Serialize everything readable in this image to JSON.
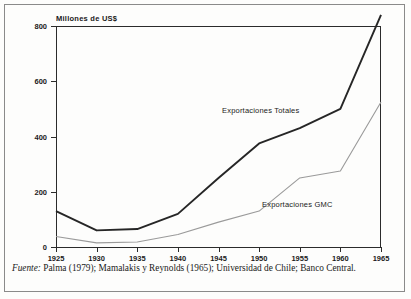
{
  "figure": {
    "y_axis_title": "Millones de US$",
    "series_labels": {
      "totales": "Exportaciones Totales",
      "gmc": "Exportaciones GMC"
    },
    "caption": {
      "source_word": "Fuente:",
      "text": " Palma (1979); Mamalakis y Reynolds (1965); Universidad de Chile; Banco Central."
    },
    "colors": {
      "totales_line": "#262626",
      "gmc_line": "#9a9a9a",
      "axis": "#2b2b2b",
      "page": "#fdfdfc",
      "frame": "#8a8a8a"
    }
  },
  "chart_data": {
    "type": "line",
    "title": "",
    "xlabel": "",
    "ylabel": "Millones de US$",
    "x": [
      1925,
      1930,
      1935,
      1940,
      1945,
      1950,
      1955,
      1960,
      1965
    ],
    "categories": [
      "1925",
      "1930",
      "1935",
      "1940",
      "1945",
      "1950",
      "1955",
      "1960",
      "1965"
    ],
    "xlim": [
      1925,
      1965
    ],
    "ylim": [
      0,
      800
    ],
    "yticks": [
      0,
      200,
      400,
      600,
      800
    ],
    "ytick_labels": [
      "0",
      "200",
      "400",
      "600",
      "800"
    ],
    "xticks": [
      1925,
      1930,
      1935,
      1940,
      1945,
      1950,
      1955,
      1960,
      1965
    ],
    "grid": false,
    "legend": "inline-annotations",
    "series": [
      {
        "name": "Exportaciones Totales",
        "color": "#262626",
        "values": [
          130,
          60,
          65,
          120,
          250,
          375,
          430,
          500,
          840
        ]
      },
      {
        "name": "Exportaciones GMC",
        "color": "#9a9a9a",
        "values": [
          38,
          15,
          18,
          45,
          90,
          130,
          250,
          275,
          525
        ]
      }
    ],
    "annotations": [
      {
        "text": "Exportaciones Totales",
        "x": 1951,
        "y": 580
      },
      {
        "text": "Exportaciones GMC",
        "x": 1956,
        "y": 160
      }
    ]
  }
}
